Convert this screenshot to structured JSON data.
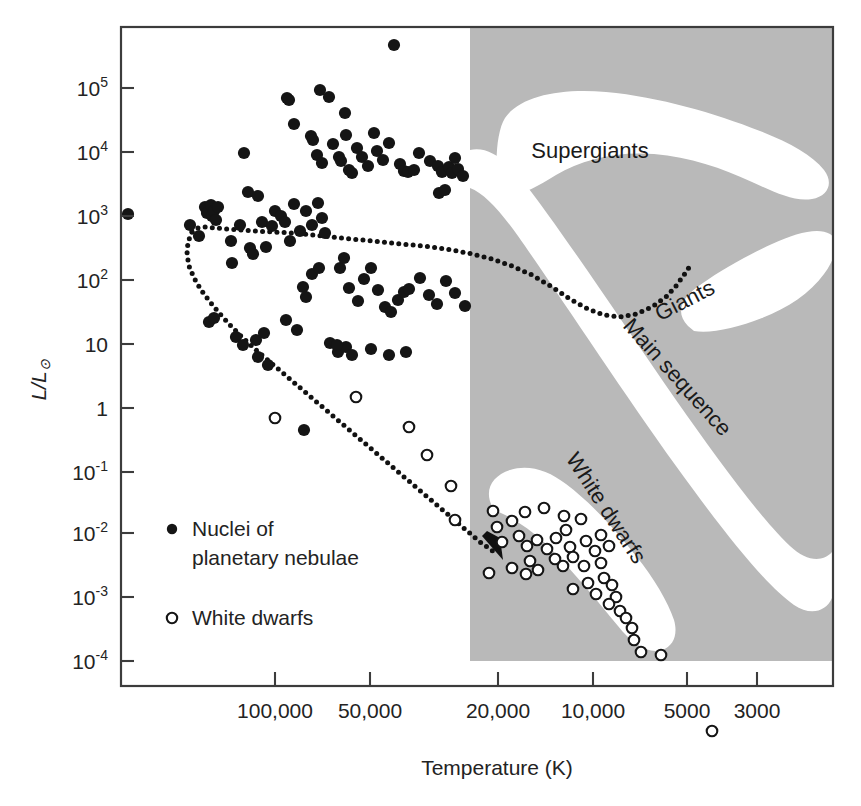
{
  "figure": {
    "kind": "hertzsprung-russell-diagram",
    "background_color": "#ffffff",
    "shade_color": "#b9b9b9",
    "frame_color": "#3c3c3c"
  },
  "axes": {
    "x": {
      "title": "Temperature (K)",
      "tick_labels": [
        "100,000",
        "50,000",
        "20,000",
        "10,000",
        "5000",
        "3000"
      ],
      "tick_values": [
        100000,
        50000,
        20000,
        10000,
        5000,
        3000
      ],
      "tick_px": [
        275,
        370,
        498,
        593,
        687,
        757
      ],
      "direction": "reversed",
      "scale": "log"
    },
    "y": {
      "title": "L/L",
      "title_symbol": "⊙",
      "tick_labels": [
        "10⁵",
        "10⁴",
        "10³",
        "10²",
        "10",
        "1",
        "10⁻¹",
        "10⁻²",
        "10⁻³",
        "10⁻⁴"
      ],
      "tick_mantissas": [
        "10",
        "10",
        "10",
        "10",
        "10",
        "1",
        "10",
        "10",
        "10",
        "10"
      ],
      "tick_exponents": [
        "5",
        "4",
        "3",
        "2",
        "",
        "",
        "-1",
        "-2",
        "-3",
        "-4"
      ],
      "tick_values": [
        100000,
        10000,
        1000,
        100,
        10,
        1,
        0.1,
        0.01,
        0.001,
        0.0001
      ],
      "tick_px": [
        88,
        152,
        216,
        280,
        344,
        408,
        472,
        533,
        597,
        661
      ],
      "scale": "log"
    }
  },
  "plot_frame": {
    "left": 121,
    "right": 833,
    "top": 27,
    "bottom": 686
  },
  "shaded_region": {
    "left": 470,
    "right": 833,
    "top": 27,
    "bottom": 661
  },
  "region_labels": [
    {
      "name": "supergiants",
      "text": "Supergiants",
      "x": 590,
      "y": 158,
      "rotate": 0
    },
    {
      "name": "giants",
      "text": "Giants",
      "x": 688,
      "y": 307,
      "rotate": -27
    },
    {
      "name": "main-sequence",
      "text": "Main sequence",
      "x": 672,
      "y": 382,
      "rotate": 48
    },
    {
      "name": "white-dwarfs",
      "text": "White dwarfs",
      "x": 600,
      "y": 512,
      "rotate": 57
    }
  ],
  "legend": {
    "entries": [
      {
        "name": "nuclei-of-planetary-nebulae",
        "marker": "filled-circle",
        "label_line1": "Nuclei of",
        "label_line2": "planetary nebulae",
        "x": 172,
        "y": 536
      },
      {
        "name": "white-dwarfs",
        "marker": "open-circle",
        "label_line1": "White dwarfs",
        "label_line2": "",
        "x": 172,
        "y": 625
      }
    ]
  },
  "chart_data": {
    "type": "scatter",
    "title": "",
    "xlabel": "Temperature (K)",
    "ylabel": "L/L⊙",
    "xscale": "log",
    "yscale": "log",
    "xlim": [
      160000,
      2600
    ],
    "ylim": [
      3e-05,
      600000
    ],
    "grid": false,
    "legend_position": "inside-lower-left",
    "annotations": [
      "Supergiants",
      "Giants",
      "Main sequence",
      "White dwarfs"
    ],
    "series": [
      {
        "name": "Nuclei of planetary nebulae",
        "marker": "filled-circle",
        "points_px": [
          [
            128,
            214
          ],
          [
            190,
            225
          ],
          [
            199,
            236
          ],
          [
            205,
            207
          ],
          [
            207,
            213
          ],
          [
            211,
            205
          ],
          [
            212,
            216
          ],
          [
            214,
            211
          ],
          [
            216,
            220
          ],
          [
            218,
            207
          ],
          [
            231,
            241
          ],
          [
            232,
            263
          ],
          [
            240,
            225
          ],
          [
            244,
            153
          ],
          [
            250,
            248
          ],
          [
            253,
            254
          ],
          [
            287,
            98
          ],
          [
            289,
            100
          ],
          [
            294,
            124
          ],
          [
            311,
            136
          ],
          [
            313,
            140
          ],
          [
            317,
            155
          ],
          [
            322,
            163
          ],
          [
            320,
            90
          ],
          [
            329,
            97
          ],
          [
            333,
            144
          ],
          [
            339,
            157
          ],
          [
            341,
            161
          ],
          [
            345,
            113
          ],
          [
            346,
            135
          ],
          [
            349,
            170
          ],
          [
            352,
            173
          ],
          [
            357,
            148
          ],
          [
            362,
            157
          ],
          [
            368,
            166
          ],
          [
            374,
            133
          ],
          [
            377,
            151
          ],
          [
            383,
            160
          ],
          [
            389,
            143
          ],
          [
            394,
            45
          ],
          [
            400,
            164
          ],
          [
            404,
            171
          ],
          [
            408,
            172
          ],
          [
            414,
            170
          ],
          [
            419,
            153
          ],
          [
            430,
            161
          ],
          [
            438,
            166
          ],
          [
            442,
            172
          ],
          [
            449,
            167
          ],
          [
            452,
            173
          ],
          [
            455,
            158
          ],
          [
            458,
            169
          ],
          [
            463,
            176
          ],
          [
            439,
            193
          ],
          [
            445,
            190
          ],
          [
            248,
            192
          ],
          [
            258,
            196
          ],
          [
            262,
            222
          ],
          [
            266,
            247
          ],
          [
            272,
            226
          ],
          [
            275,
            211
          ],
          [
            281,
            216
          ],
          [
            285,
            222
          ],
          [
            290,
            241
          ],
          [
            294,
            204
          ],
          [
            300,
            231
          ],
          [
            306,
            211
          ],
          [
            312,
            225
          ],
          [
            318,
            203
          ],
          [
            322,
            218
          ],
          [
            325,
            233
          ],
          [
            312,
            274
          ],
          [
            319,
            268
          ],
          [
            303,
            287
          ],
          [
            306,
            297
          ],
          [
            340,
            268
          ],
          [
            344,
            258
          ],
          [
            349,
            288
          ],
          [
            358,
            301
          ],
          [
            364,
            279
          ],
          [
            371,
            268
          ],
          [
            378,
            290
          ],
          [
            385,
            307
          ],
          [
            391,
            312
          ],
          [
            398,
            300
          ],
          [
            404,
            292
          ],
          [
            409,
            289
          ],
          [
            420,
            278
          ],
          [
            429,
            295
          ],
          [
            437,
            304
          ],
          [
            446,
            281
          ],
          [
            455,
            293
          ],
          [
            465,
            306
          ],
          [
            209,
            322
          ],
          [
            214,
            318
          ],
          [
            236,
            337
          ],
          [
            243,
            345
          ],
          [
            256,
            340
          ],
          [
            264,
            333
          ],
          [
            286,
            320
          ],
          [
            297,
            330
          ],
          [
            330,
            343
          ],
          [
            338,
            352
          ],
          [
            346,
            347
          ],
          [
            352,
            355
          ],
          [
            371,
            349
          ],
          [
            389,
            355
          ],
          [
            406,
            352
          ],
          [
            304,
            430
          ],
          [
            337,
            345
          ],
          [
            258,
            357
          ],
          [
            268,
            365
          ]
        ]
      },
      {
        "name": "White dwarfs",
        "marker": "open-circle",
        "points_px": [
          [
            275,
            418
          ],
          [
            356,
            397
          ],
          [
            409,
            427
          ],
          [
            427,
            455
          ],
          [
            451,
            486
          ],
          [
            455,
            520
          ],
          [
            512,
            521
          ],
          [
            525,
            512
          ],
          [
            544,
            508
          ],
          [
            564,
            516
          ],
          [
            566,
            530
          ],
          [
            581,
            519
          ],
          [
            519,
            536
          ],
          [
            527,
            546
          ],
          [
            537,
            540
          ],
          [
            547,
            549
          ],
          [
            556,
            538
          ],
          [
            570,
            547
          ],
          [
            586,
            541
          ],
          [
            555,
            559
          ],
          [
            563,
            566
          ],
          [
            573,
            557
          ],
          [
            584,
            566
          ],
          [
            595,
            551
          ],
          [
            601,
            563
          ],
          [
            512,
            568
          ],
          [
            530,
            561
          ],
          [
            526,
            574
          ],
          [
            538,
            570
          ],
          [
            604,
            578
          ],
          [
            612,
            585
          ],
          [
            616,
            597
          ],
          [
            609,
            604
          ],
          [
            620,
            611
          ],
          [
            626,
            618
          ],
          [
            632,
            628
          ],
          [
            634,
            640
          ],
          [
            641,
            652
          ],
          [
            661,
            655
          ],
          [
            596,
            594
          ],
          [
            588,
            583
          ],
          [
            573,
            589
          ],
          [
            601,
            535
          ],
          [
            609,
            546
          ],
          [
            493,
            511
          ],
          [
            497,
            527
          ],
          [
            502,
            542
          ],
          [
            489,
            573
          ],
          [
            712,
            731
          ]
        ]
      }
    ],
    "evolution_track": {
      "name": "post-agb evolutionary track",
      "style": "dotted",
      "has_arrowhead": true,
      "path_px": [
        [
          192,
          232
        ],
        [
          198,
          228
        ],
        [
          206,
          227
        ],
        [
          216,
          228
        ],
        [
          228,
          229
        ],
        [
          240,
          230
        ],
        [
          256,
          231
        ],
        [
          272,
          232
        ],
        [
          292,
          233
        ],
        [
          312,
          235
        ],
        [
          332,
          237
        ],
        [
          352,
          239
        ],
        [
          372,
          241
        ],
        [
          392,
          243
        ],
        [
          412,
          245
        ],
        [
          432,
          247
        ],
        [
          452,
          250
        ],
        [
          472,
          254
        ],
        [
          492,
          259
        ],
        [
          512,
          266
        ],
        [
          532,
          275
        ],
        [
          552,
          287
        ],
        [
          570,
          299
        ],
        [
          588,
          309
        ],
        [
          604,
          315
        ],
        [
          620,
          317
        ],
        [
          636,
          314
        ],
        [
          652,
          307
        ],
        [
          666,
          297
        ],
        [
          676,
          286
        ],
        [
          684,
          275
        ],
        [
          690,
          266
        ]
      ],
      "descent_px": [
        [
          192,
          232
        ],
        [
          188,
          242
        ],
        [
          187,
          254
        ],
        [
          189,
          266
        ],
        [
          194,
          278
        ],
        [
          201,
          290
        ],
        [
          210,
          302
        ],
        [
          220,
          314
        ],
        [
          231,
          326
        ],
        [
          243,
          338
        ],
        [
          256,
          350
        ],
        [
          270,
          362
        ],
        [
          284,
          374
        ],
        [
          298,
          386
        ],
        [
          312,
          398
        ],
        [
          326,
          410
        ],
        [
          340,
          422
        ],
        [
          354,
          434
        ],
        [
          368,
          446
        ],
        [
          382,
          458
        ],
        [
          396,
          470
        ],
        [
          410,
          482
        ],
        [
          424,
          494
        ],
        [
          438,
          506
        ],
        [
          452,
          518
        ],
        [
          466,
          530
        ],
        [
          480,
          542
        ],
        [
          494,
          552
        ]
      ]
    }
  }
}
